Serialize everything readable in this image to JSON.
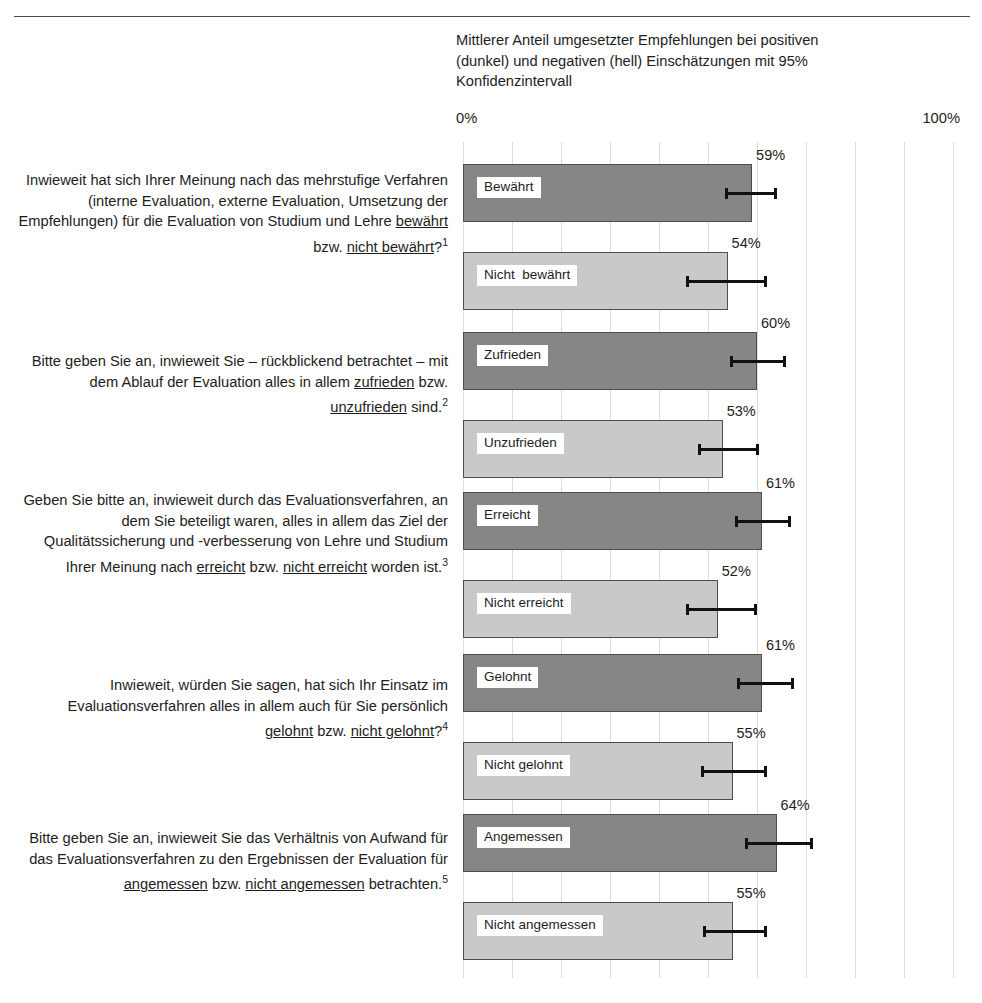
{
  "chart_data": {
    "type": "bar",
    "orientation": "horizontal",
    "title_lines": [
      "Mittlerer Anteil umgesetzter Empfehlungen bei positiven",
      "(dunkel) und negativen (hell) Einschätzungen mit 95%",
      "Konfidenzintervall"
    ],
    "xlabel": "",
    "ylabel": "",
    "xlim": [
      0,
      100
    ],
    "axis_min_label": "0%",
    "axis_max_label": "100%",
    "grid": true,
    "grid_step": 10,
    "legend": {
      "position": "in-title",
      "entries": [
        {
          "name": "positive Einschätzung (dunkel)",
          "color": "#868686"
        },
        {
          "name": "negative Einschätzung (hell)",
          "color": "#c9c9c9"
        }
      ]
    },
    "categories": [
      "Bewährt",
      "Nicht  bewährt",
      "Zufrieden",
      "Unzufrieden",
      "Erreicht",
      "Nicht erreicht",
      "Gelohnt",
      "Nicht gelohnt",
      "Angemessen",
      "Nicht angemessen"
    ],
    "values": [
      59,
      54,
      60,
      53,
      61,
      52,
      61,
      55,
      64,
      55
    ],
    "value_labels": [
      "59%",
      "54%",
      "60%",
      "53%",
      "61%",
      "52%",
      "61%",
      "55%",
      "64%",
      "55%"
    ],
    "ci_low": [
      53.5,
      45.5,
      54.5,
      48.0,
      55.5,
      45.5,
      56.0,
      48.5,
      57.5,
      49.0
    ],
    "ci_high": [
      64.0,
      62.0,
      66.0,
      60.5,
      67.0,
      60.0,
      67.5,
      62.0,
      71.5,
      62.0
    ],
    "tone": [
      "dark",
      "light",
      "dark",
      "light",
      "dark",
      "light",
      "dark",
      "light",
      "dark",
      "light"
    ]
  },
  "bars": [
    {
      "label": "Bewährt",
      "value": 59,
      "value_label": "59%",
      "tone": "dark",
      "ci_low": 53.5,
      "ci_high": 64.0,
      "top": 22
    },
    {
      "label": "Nicht  bewährt",
      "value": 54,
      "value_label": "54%",
      "tone": "light",
      "ci_low": 45.5,
      "ci_high": 62.0,
      "top": 110
    },
    {
      "label": "Zufrieden",
      "value": 60,
      "value_label": "60%",
      "tone": "dark",
      "ci_low": 54.5,
      "ci_high": 66.0,
      "top": 190
    },
    {
      "label": "Unzufrieden",
      "value": 53,
      "value_label": "53%",
      "tone": "light",
      "ci_low": 48.0,
      "ci_high": 60.5,
      "top": 278
    },
    {
      "label": "Erreicht",
      "value": 61,
      "value_label": "61%",
      "tone": "dark",
      "ci_low": 55.5,
      "ci_high": 67.0,
      "top": 350
    },
    {
      "label": "Nicht erreicht",
      "value": 52,
      "value_label": "52%",
      "tone": "light",
      "ci_low": 45.5,
      "ci_high": 60.0,
      "top": 438
    },
    {
      "label": "Gelohnt",
      "value": 61,
      "value_label": "61%",
      "tone": "dark",
      "ci_low": 56.0,
      "ci_high": 67.5,
      "top": 512
    },
    {
      "label": "Nicht gelohnt",
      "value": 55,
      "value_label": "55%",
      "tone": "light",
      "ci_low": 48.5,
      "ci_high": 62.0,
      "top": 600
    },
    {
      "label": "Angemessen",
      "value": 64,
      "value_label": "64%",
      "tone": "dark",
      "ci_low": 57.5,
      "ci_high": 71.5,
      "top": 672
    },
    {
      "label": "Nicht angemessen",
      "value": 55,
      "value_label": "55%",
      "tone": "light",
      "ci_low": 49.0,
      "ci_high": 62.0,
      "top": 760
    }
  ],
  "questions": [
    {
      "id": 1,
      "top": 170,
      "footnote": "1",
      "text": "Inwieweit hat sich Ihrer Meinung nach das mehrstufige Verfahren (interne Evaluation, externe Evaluation, Umsetzung der Empfehlungen) für die Evaluation von Studium und Lehre bewährt bzw. nicht bewährt?",
      "parts": [
        {
          "t": "Inwieweit hat sich Ihrer Meinung nach das mehrstufige Verfahren (interne Evaluation, externe Evaluation, Umsetzung der Empfehlungen) für die Evaluation von Studium und Lehre ",
          "u": false
        },
        {
          "t": "bewährt",
          "u": true
        },
        {
          "t": " bzw. ",
          "u": false
        },
        {
          "t": "nicht bewährt",
          "u": true
        },
        {
          "t": "?",
          "u": false
        }
      ]
    },
    {
      "id": 2,
      "top": 351,
      "footnote": "2",
      "text": "Bitte geben Sie an, inwieweit Sie – rückblickend betrachtet – mit dem Ablauf der Evaluation alles in allem zufrieden bzw. unzufrieden sind.",
      "parts": [
        {
          "t": "Bitte geben Sie an, inwieweit Sie –  rückblickend betrachtet – mit dem Ablauf der Evaluation alles in allem ",
          "u": false
        },
        {
          "t": "zufrieden",
          "u": true
        },
        {
          "t": " bzw. ",
          "u": false
        },
        {
          "t": "unzufrieden",
          "u": true
        },
        {
          "t": " sind.",
          "u": false
        }
      ]
    },
    {
      "id": 3,
      "top": 490,
      "footnote": "3",
      "text": "Geben Sie bitte an, inwieweit durch das Evaluationsverfahren, an dem Sie beteiligt waren, alles in allem das Ziel der Qualitätssicherung und -verbesserung von Lehre und Studium Ihrer Meinung nach erreicht bzw. nicht erreicht worden ist.",
      "parts": [
        {
          "t": "Geben Sie bitte an, inwieweit durch das Evaluationsverfahren, an dem Sie beteiligt waren, alles in allem das Ziel der Qualitätssicherung und -verbesserung von Lehre und Studium Ihrer Meinung nach ",
          "u": false
        },
        {
          "t": "erreicht",
          "u": true
        },
        {
          "t": " bzw. ",
          "u": false
        },
        {
          "t": "nicht erreicht",
          "u": true
        },
        {
          "t": " worden ist.",
          "u": false
        }
      ]
    },
    {
      "id": 4,
      "top": 675,
      "footnote": "4",
      "text": "Inwieweit, würden Sie sagen, hat sich Ihr Einsatz im Evaluationsverfahren alles in allem auch für Sie persönlich gelohnt bzw. nicht gelohnt?",
      "parts": [
        {
          "t": "Inwieweit, würden Sie sagen, hat sich Ihr Einsatz im Evaluationsverfahren alles in allem auch für Sie persönlich ",
          "u": false
        },
        {
          "t": "gelohnt",
          "u": true
        },
        {
          "t": " bzw. ",
          "u": false
        },
        {
          "t": "nicht gelohnt",
          "u": true
        },
        {
          "t": "?",
          "u": false
        }
      ]
    },
    {
      "id": 5,
      "top": 828,
      "footnote": "5",
      "text": "Bitte geben Sie an, inwieweit Sie das Verhältnis von Aufwand für das Evaluationsverfahren zu den Ergebnissen der Evaluation für angemessen bzw. nicht angemessen betrachten.",
      "parts": [
        {
          "t": "Bitte geben Sie an, inwieweit Sie das Verhältnis von Aufwand für das Evaluationsverfahren zu den Ergebnissen der Evaluation für ",
          "u": false
        },
        {
          "t": "angemessen",
          "u": true
        },
        {
          "t": " bzw. ",
          "u": false
        },
        {
          "t": "nicht angemessen",
          "u": true
        },
        {
          "t": " betrachten.",
          "u": false
        }
      ]
    }
  ],
  "colors": {
    "bar_dark": "#868686",
    "bar_light": "#c9c9c9",
    "bar_border": "#4d4d4d",
    "gridline": "#dcdcdc",
    "errorbar": "#111111",
    "rule": "#4a4a4a",
    "text": "#1d1d1d"
  }
}
